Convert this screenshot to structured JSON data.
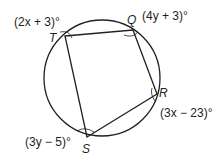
{
  "diagram": {
    "type": "inscribed-quadrilateral",
    "circle": {
      "cx": 102,
      "cy": 78,
      "r": 58
    },
    "vertices": [
      {
        "name": "T",
        "x": 65,
        "y": 36,
        "angle_label": "(2x + 3)°"
      },
      {
        "name": "Q",
        "x": 133,
        "y": 30,
        "angle_label": "(4y + 3)°"
      },
      {
        "name": "R",
        "x": 157,
        "y": 94,
        "angle_label": "(3x − 23)°"
      },
      {
        "name": "S",
        "x": 87,
        "y": 137,
        "angle_label": "(3y − 5)°"
      }
    ],
    "colors": {
      "stroke": "#231f20",
      "background": "#ffffff"
    }
  }
}
